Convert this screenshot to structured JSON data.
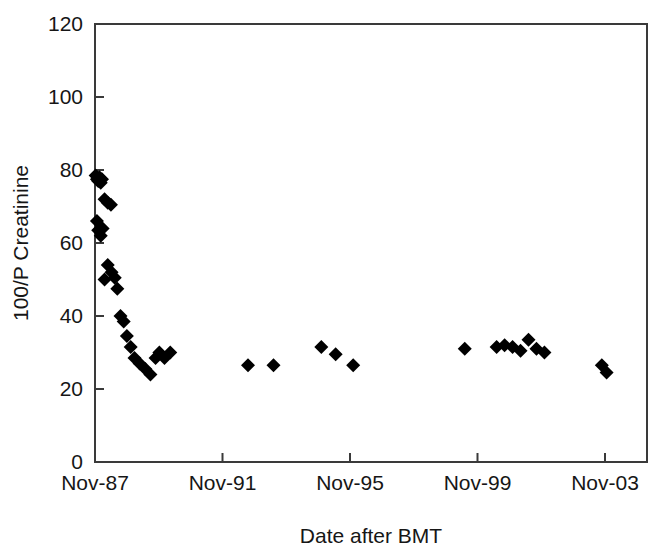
{
  "chart_data": {
    "type": "scatter",
    "title": "",
    "xlabel": "Date after BMT",
    "ylabel": "100/P Creatinine",
    "ylim": [
      0,
      120
    ],
    "yticks": [
      0,
      20,
      40,
      60,
      80,
      100,
      120
    ],
    "ytick_labels": [
      "0",
      "20",
      "40",
      "60",
      "80",
      "100",
      "120"
    ],
    "xticks": [
      0,
      4,
      8,
      12,
      16
    ],
    "xtick_labels": [
      "Nov-87",
      "Nov-91",
      "Nov-95",
      "Nov-99",
      "Nov-03"
    ],
    "xlim": [
      -0.25,
      17.0
    ],
    "x_unit": "years after Nov-87",
    "grid": false,
    "legend": null,
    "marker": "diamond",
    "marker_color": "#000000",
    "marker_size": 11,
    "series": [
      {
        "name": "100/P Creatinine",
        "x": [
          0.02,
          0.06,
          0.1,
          0.14,
          0.18,
          0.22,
          0.3,
          0.4,
          0.5,
          0.06,
          0.1,
          0.18,
          0.24,
          0.3,
          0.4,
          0.52,
          0.62,
          0.7,
          0.8,
          0.9,
          1.0,
          1.12,
          1.24,
          1.4,
          1.58,
          1.74,
          1.9,
          2.02,
          2.18,
          2.36,
          4.8,
          5.6,
          7.1,
          7.55,
          8.1,
          11.6,
          12.6,
          12.85,
          13.1,
          13.35,
          13.6,
          13.85,
          14.1,
          15.9,
          16.05
        ],
        "y": [
          78.5,
          77.5,
          77.0,
          78.0,
          76.5,
          77.5,
          72.0,
          71.0,
          70.5,
          66.0,
          63.5,
          62.0,
          64.0,
          50.0,
          54.0,
          52.0,
          50.5,
          47.5,
          40.0,
          38.5,
          34.5,
          31.5,
          28.5,
          27.0,
          25.5,
          24.0,
          28.5,
          30.0,
          28.5,
          30.0,
          26.5,
          26.5,
          31.5,
          29.5,
          26.5,
          31.0,
          31.5,
          32.0,
          31.5,
          30.5,
          33.5,
          31.0,
          30.0,
          26.5,
          24.5
        ]
      }
    ]
  },
  "axis": {
    "y_title": "100/P Creatinine",
    "x_title": "Date after BMT"
  }
}
